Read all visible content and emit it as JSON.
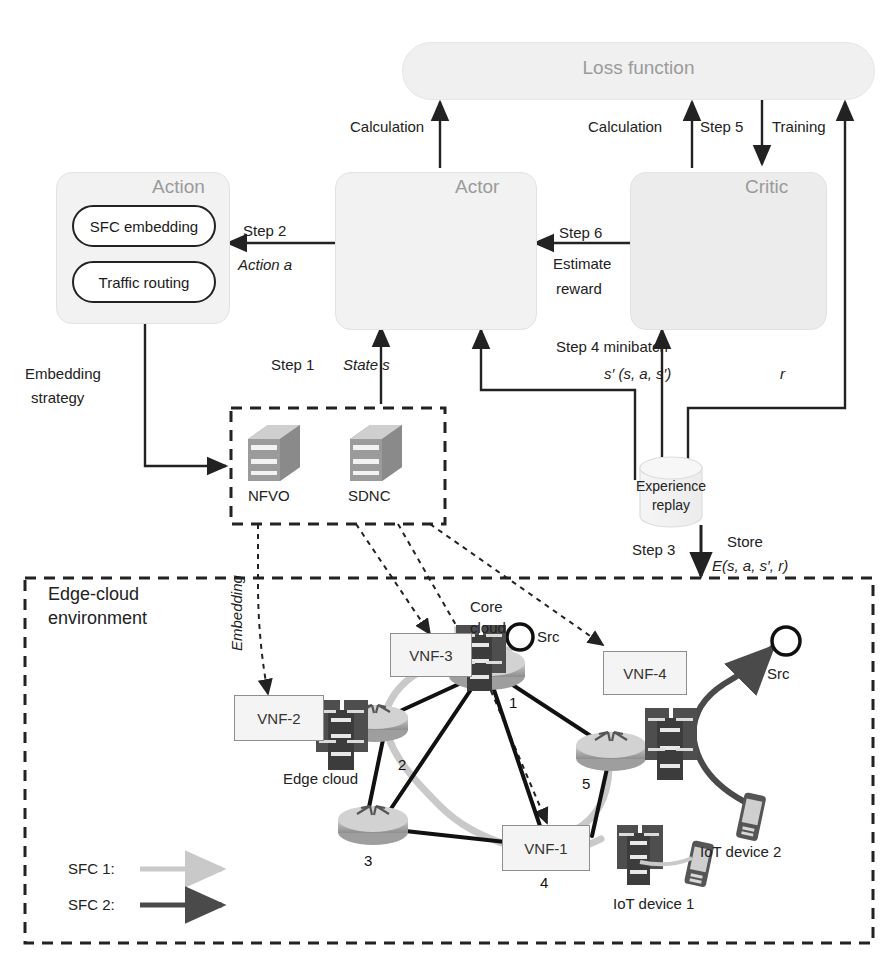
{
  "modules": {
    "loss_function": "Loss function",
    "actor": "Actor",
    "critic": "Critic",
    "action": "Action",
    "action_items": [
      "SFC embedding",
      "Traffic routing"
    ],
    "experience_replay_l1": "Experience",
    "experience_replay_l2": "replay",
    "orchestrators": [
      "NFVO",
      "SDNC"
    ],
    "environment_l1": "Edge-cloud",
    "environment_l2": "environment"
  },
  "edges": {
    "calculation_actor": "Calculation",
    "calculation_critic": "Calculation",
    "step5": "Step 5",
    "training": "Training",
    "step6": "Step 6",
    "estimate_reward_l1": "Estimate",
    "estimate_reward_l2": "reward",
    "step2": "Step 2",
    "action_a": "Action a",
    "step1": "Step 1",
    "state_s": "State s",
    "step4": "Step 4 minibatch",
    "minibatch_tuple": "s′ (s, a, s′)",
    "reward_r": "r",
    "step3": "Step 3",
    "store": "Store",
    "store_tuple": "E(s, a, s′, r)",
    "embedding_strategy_l1": "Embedding",
    "embedding_strategy_l2": "strategy",
    "embedding": "Embedding"
  },
  "environment": {
    "core_cloud_l1": "Core",
    "core_cloud_l2": "cloud",
    "edge_cloud": "Edge cloud",
    "vnfs": [
      "VNF-1",
      "VNF-2",
      "VNF-3",
      "VNF-4"
    ],
    "src_labels": [
      "Src",
      "Src"
    ],
    "iot_devices": [
      "IoT device 1",
      "IoT device 2"
    ],
    "router_numbers": [
      "1",
      "2",
      "3",
      "4",
      "5"
    ],
    "legend": [
      {
        "label": "SFC 1:",
        "color": "#c9c9c9"
      },
      {
        "label": "SFC 2:",
        "color": "#4a4a4a"
      }
    ]
  },
  "colors": {
    "panel_fill": "#f2f2f2",
    "panel_stroke": "#e2e2e2",
    "ink": "#222222",
    "gray_title": "#9a9a9a",
    "sfc1": "#c9c9c9",
    "sfc2": "#4a4a4a",
    "router_body": "#b5b5b5",
    "server_dark": "#4e4e4e"
  }
}
